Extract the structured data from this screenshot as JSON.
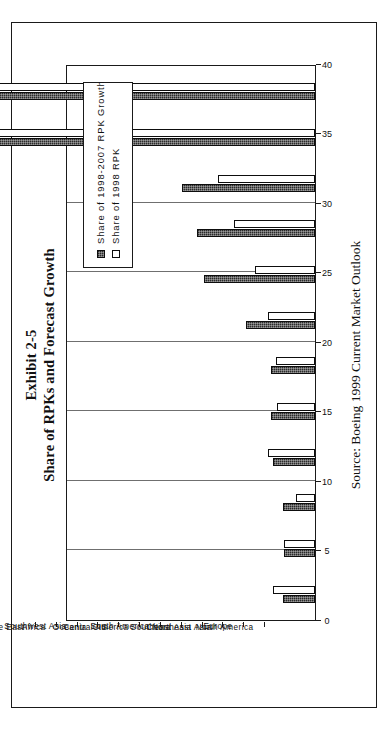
{
  "figure": {
    "exhibit_label": "Exhibit 2-5",
    "title": "Share of RPKs and Forecast Growth",
    "source": "Source: Boeing 1999 Current Market Outlook"
  },
  "legend": {
    "position": "top-right-inside-plot",
    "entries": [
      {
        "label": "Share of 1998-2007 RPK Growth",
        "swatch": "filled-black",
        "color": "#2b2b2b"
      },
      {
        "label": "Share of 1998 RPK",
        "swatch": "open-white",
        "color": "#ffffff"
      }
    ]
  },
  "chart_data": {
    "type": "bar",
    "orientation": "vertical-bars-printed-sideways",
    "title": "Share of RPKs and Forecast Growth",
    "subtitle": "Exhibit 2-5",
    "xlabel": "",
    "ylabel": "",
    "ylim": [
      0,
      40
    ],
    "yticks": [
      0,
      5,
      10,
      15,
      20,
      25,
      30,
      35,
      40
    ],
    "grid": true,
    "grid_axis": "y",
    "legend_position": "upper right",
    "annotations": [
      "Source: Boeing 1999 Current Market Outlook"
    ],
    "categories": [
      "Middle East",
      "Africa",
      "Southwest Asia",
      "Oceania",
      "CIS",
      "Central America",
      "South America",
      "China",
      "Southeast Asia",
      "Northeast Asia",
      "Europe",
      "North America"
    ],
    "series": [
      {
        "name": "Share of 1998-2007 RPK Growth",
        "color": "#2b2b2b",
        "values": [
          2.3,
          2.2,
          2.3,
          3.0,
          3.2,
          3.2,
          5.0,
          8.0,
          8.5,
          9.6,
          25.5,
          26.7
        ]
      },
      {
        "name": "Share of 1998 RPK",
        "color": "#ffffff",
        "values": [
          3.0,
          2.2,
          1.4,
          3.4,
          2.7,
          2.8,
          3.4,
          4.3,
          5.8,
          7.0,
          26.2,
          37.5
        ]
      }
    ]
  }
}
